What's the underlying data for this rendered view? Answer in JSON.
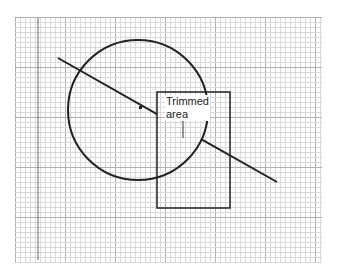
{
  "diagram": {
    "annotation": {
      "line1": "Trimmed",
      "line2": "area"
    },
    "grid": {
      "x": 15,
      "y": 17,
      "width": 307,
      "height": 245,
      "minor_step": 5,
      "major_step": 50,
      "minor_color": "#d8d8d8",
      "major_color": "#b0b0b0"
    },
    "axis_line": {
      "x": 38,
      "y1": 18,
      "y2": 260,
      "color": "#666666"
    },
    "circle": {
      "cx": 138,
      "cy": 110,
      "r": 70,
      "color": "#222222"
    },
    "rectangle": {
      "x": 157,
      "y": 92,
      "width": 73,
      "height": 116,
      "color": "#222222"
    },
    "line": {
      "x1": 58,
      "y1": 58,
      "x2": 277,
      "y2": 182,
      "trim_start_x": 157,
      "color": "#222222"
    },
    "point": {
      "x": 140,
      "y": 107
    }
  }
}
